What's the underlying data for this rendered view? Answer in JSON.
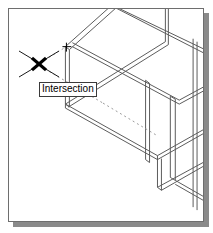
{
  "app": {
    "viewport_name": "cad-drawing-viewport",
    "background_color": "#ffffff",
    "border_color": "#6e6e6e",
    "shadow_color": "#8a8a8a"
  },
  "snap": {
    "tooltip_label": "Intersection",
    "marker_icon": "intersection-snap-x-icon",
    "marker_color": "#000000",
    "tracking_line_style": "dashed",
    "tracking_line_color": "#9a9a9a"
  },
  "geometry": {
    "line_color": "#5a5a5a",
    "description_name": "isometric-structural-frame",
    "style": "double-line-wireframe",
    "members": [
      {
        "name": "top-left-diagonal-beam"
      },
      {
        "name": "top-right-diagonal-beam"
      },
      {
        "name": "upper-vertical-column"
      },
      {
        "name": "center-crossing-beam"
      },
      {
        "name": "mid-diagonal-beam"
      },
      {
        "name": "long-lower-diagonal-beam"
      },
      {
        "name": "right-vertical-column"
      },
      {
        "name": "right-lower-beam"
      },
      {
        "name": "far-right-column"
      },
      {
        "name": "bottom-right-diagonal-beam"
      }
    ]
  },
  "nodes": {
    "snap_node_label": "intersection-node-marker",
    "center_crossing_label": "beam-crossing-point"
  }
}
